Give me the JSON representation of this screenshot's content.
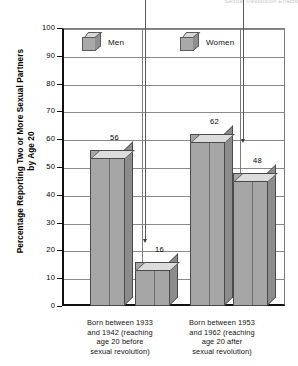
{
  "chart_data": {
    "type": "bar",
    "title": "",
    "top_cut_text": "Sexual Revolution Effects",
    "xlabel": "",
    "ylabel": "Percentage Reporting Two or More Sexual Partners by Age 20",
    "ylim": [
      0,
      100
    ],
    "ytick_step": 10,
    "yticks": [
      "100",
      "90",
      "80",
      "70",
      "60",
      "50",
      "40",
      "30",
      "20",
      "10",
      "0"
    ],
    "grid": true,
    "legend_position": "top-inside",
    "categories": [
      "Born between 1933 and 1942 (reaching age 20 before sexual revolution)",
      "Born between 1953 and 1962 (reaching age 20 after sexual revolution)"
    ],
    "category_lines": [
      [
        "Born between 1933",
        "and 1942 (reaching",
        "age 20 before",
        "sexual revolution)"
      ],
      [
        "Born between 1953",
        "and 1962 (reaching",
        "age 20 after",
        "sexual revolution)"
      ]
    ],
    "series": [
      {
        "name": "Men",
        "values": [
          56,
          62
        ]
      },
      {
        "name": "Women",
        "values": [
          16,
          48
        ]
      }
    ],
    "annotations": [
      {
        "label": "16",
        "leader": true
      },
      {
        "label": "48",
        "leader": true
      }
    ]
  },
  "legend": {
    "men": "Men",
    "women": "Women"
  },
  "colors": {
    "bar_front": "#a6a6a6",
    "bar_top": "#dcdcdc",
    "bar_side": "#8c8c8c",
    "grid": "#8a8a8a",
    "axis": "#111111"
  }
}
